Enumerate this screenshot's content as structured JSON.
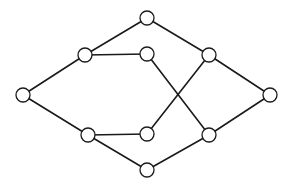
{
  "diagram": {
    "type": "graph",
    "node_radius": 7,
    "colors": {
      "stroke": "#1a1a1a",
      "node_fill": "#ffffff",
      "background": "#ffffff"
    },
    "nodes": [
      {
        "id": "left",
        "x": 23,
        "y": 95
      },
      {
        "id": "upper-left",
        "x": 85,
        "y": 55
      },
      {
        "id": "lower-left",
        "x": 88,
        "y": 135
      },
      {
        "id": "top",
        "x": 147,
        "y": 18
      },
      {
        "id": "upper-mid",
        "x": 147,
        "y": 54
      },
      {
        "id": "lower-mid",
        "x": 147,
        "y": 134
      },
      {
        "id": "bottom",
        "x": 147,
        "y": 170
      },
      {
        "id": "upper-right",
        "x": 209,
        "y": 55
      },
      {
        "id": "lower-right",
        "x": 209,
        "y": 135
      },
      {
        "id": "right",
        "x": 270,
        "y": 95
      }
    ],
    "edges": [
      [
        "left",
        "upper-left"
      ],
      [
        "left",
        "lower-left"
      ],
      [
        "upper-left",
        "top"
      ],
      [
        "upper-left",
        "upper-mid"
      ],
      [
        "lower-left",
        "lower-mid"
      ],
      [
        "lower-left",
        "bottom"
      ],
      [
        "top",
        "upper-right"
      ],
      [
        "bottom",
        "lower-right"
      ],
      [
        "upper-mid",
        "lower-right"
      ],
      [
        "lower-mid",
        "upper-right"
      ],
      [
        "upper-right",
        "right"
      ],
      [
        "lower-right",
        "right"
      ]
    ]
  }
}
